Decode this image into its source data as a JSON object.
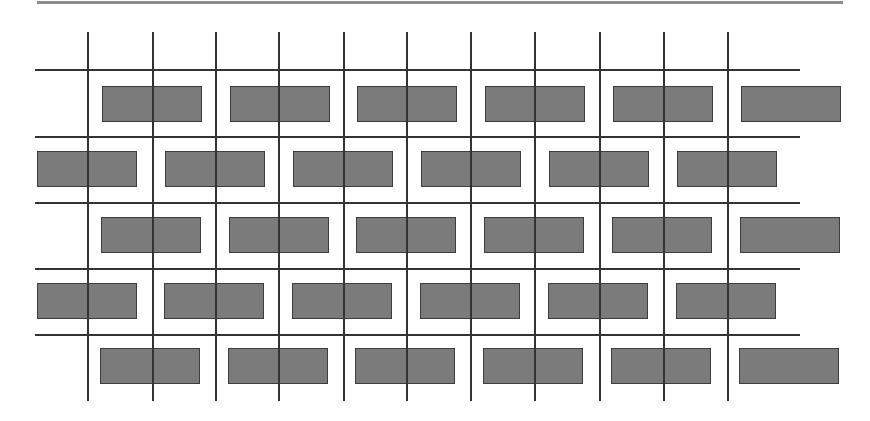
{
  "diagram": {
    "type": "brick-pattern-over-grid",
    "colors": {
      "background": "#ffffff",
      "top_rule": "#8c8c8c",
      "grid_line": "#333333",
      "brick_fill": "#7b7b7b",
      "brick_border": "#3d3d3d"
    },
    "top_rule": {
      "x1": 37,
      "x2": 843,
      "y": 1
    },
    "grid": {
      "horizontal_lines": [
        {
          "y": 69,
          "x1": 35,
          "x2": 800
        },
        {
          "y": 136,
          "x1": 35,
          "x2": 800
        },
        {
          "y": 202,
          "x1": 35,
          "x2": 800
        },
        {
          "y": 268,
          "x1": 35,
          "x2": 800
        },
        {
          "y": 334,
          "x1": 35,
          "x2": 800
        }
      ],
      "vertical_lines": [
        {
          "x": 87,
          "y1": 32,
          "y2": 401
        },
        {
          "x": 152,
          "y1": 32,
          "y2": 401
        },
        {
          "x": 215,
          "y1": 32,
          "y2": 401
        },
        {
          "x": 278,
          "y1": 32,
          "y2": 401
        },
        {
          "x": 343,
          "y1": 32,
          "y2": 401
        },
        {
          "x": 406,
          "y1": 32,
          "y2": 401
        },
        {
          "x": 470,
          "y1": 32,
          "y2": 401
        },
        {
          "x": 534,
          "y1": 32,
          "y2": 401
        },
        {
          "x": 599,
          "y1": 32,
          "y2": 401
        },
        {
          "x": 663,
          "y1": 32,
          "y2": 401
        },
        {
          "x": 727,
          "y1": 32,
          "y2": 401
        }
      ]
    },
    "brick_size": {
      "width": 100,
      "height": 36
    },
    "brick_rows": [
      {
        "y": 86,
        "x_starts": [
          102,
          230,
          357,
          485,
          613,
          741
        ]
      },
      {
        "y": 151,
        "x_starts": [
          37,
          165,
          293,
          421,
          549,
          677
        ]
      },
      {
        "y": 217,
        "x_starts": [
          101,
          229,
          356,
          484,
          612,
          740
        ]
      },
      {
        "y": 283,
        "x_starts": [
          37,
          164,
          292,
          420,
          548,
          676
        ]
      },
      {
        "y": 348,
        "x_starts": [
          100,
          228,
          355,
          483,
          611,
          739
        ]
      }
    ]
  }
}
